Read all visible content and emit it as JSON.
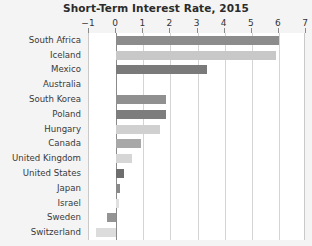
{
  "chart_data": {
    "type": "bar",
    "orientation": "horizontal",
    "title": "Short-Term Interest Rate, 2015",
    "xlabel": "",
    "ylabel": "",
    "xlim": [
      -1,
      7
    ],
    "xticks": [
      -1,
      0,
      1,
      2,
      3,
      4,
      5,
      6,
      7
    ],
    "xticklabels": [
      "−1",
      "0",
      "1",
      "2",
      "3",
      "4",
      "5",
      "6",
      "7"
    ],
    "grid": true,
    "grid_axis": "x",
    "legend": "none",
    "axis_position": "top",
    "categories": [
      "South Africa",
      "Iceland",
      "Mexico",
      "Australia",
      "South Korea",
      "Poland",
      "Hungary",
      "Canada",
      "United Kingdom",
      "United States",
      "Japan",
      "Israel",
      "Sweden",
      "Switzerland"
    ],
    "values": [
      6.0,
      5.9,
      3.35,
      0.0,
      1.85,
      1.85,
      1.6,
      0.9,
      0.6,
      0.3,
      0.15,
      0.1,
      -0.35,
      -0.75
    ],
    "bar_colors": [
      "#8c8c8c",
      "#c8c8c8",
      "#7a7a7a",
      "#b5b5b5",
      "#909090",
      "#7d7d7d",
      "#d0d0d0",
      "#a8a8a8",
      "#d6d6d6",
      "#6e6e6e",
      "#8a8a8a",
      "#e0e0e0",
      "#949494",
      "#dcdcdc"
    ]
  },
  "colors": {
    "page_background": "#f4f4f4",
    "plot_background": "#ffffff",
    "gridline": "#d4d4d4",
    "zero_line": "#8a8a8a",
    "title_text": "#2b2b2b",
    "label_text": "#3a3a3a"
  }
}
